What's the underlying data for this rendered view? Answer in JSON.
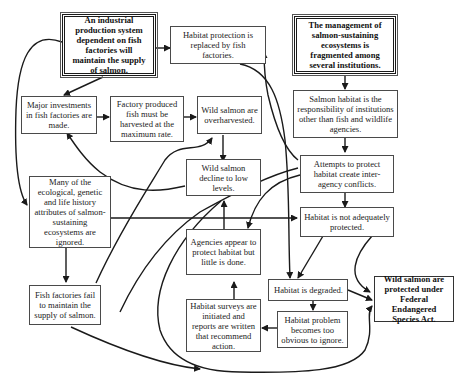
{
  "diagram": {
    "type": "causal-loop flowchart",
    "nodes": {
      "industrial_system": "An industrial production system dependent on fish factories will maintain the supply of salmon.",
      "habitat_protection_replaced": "Habitat protection is replaced by fish factories.",
      "management_fragmented": "The management of salmon-sustaining ecosystems is fragmented among several institutions.",
      "major_investments": "Major investments in fish factories are made.",
      "factory_fish_harvested": "Factory produced fish must be harvested at the maximum rate.",
      "wild_overharvested": "Wild salmon are overharvested.",
      "habitat_responsibility": "Salmon habitat is the responsibility of institutions other than fish and wildlife agencies.",
      "wild_decline": "Wild salmon decline to low levels.",
      "attempts_conflicts": "Attempts to protect habitat create inter-agency conflicts.",
      "attributes_ignored": "Many of the ecological, genetic and life history attributes of salmon-sustaining ecosystems are ignored.",
      "habitat_not_protected": "Habitat is not adequately protected.",
      "agencies_appear": "Agencies appear to protect habitat but little is done.",
      "habitat_degraded": "Habitat is degraded.",
      "factories_fail": "Fish factories fail to maintain the supply of salmon.",
      "surveys_initiated": "Habitat surveys are initiated and reports are written that recommend action.",
      "problem_obvious": "Habitat problem becomes too obvious to ignore.",
      "esa_protected": "Wild salmon are protected under Federal Endangered Species Act."
    },
    "edges": [
      {
        "from": "industrial_system",
        "to": "habitat_protection_replaced"
      },
      {
        "from": "industrial_system",
        "to": "major_investments"
      },
      {
        "from": "industrial_system",
        "to": "attributes_ignored"
      },
      {
        "from": "major_investments",
        "to": "factory_fish_harvested"
      },
      {
        "from": "factory_fish_harvested",
        "to": "wild_overharvested"
      },
      {
        "from": "wild_overharvested",
        "to": "wild_decline"
      },
      {
        "from": "wild_decline",
        "to": "major_investments"
      },
      {
        "from": "management_fragmented",
        "to": "habitat_responsibility"
      },
      {
        "from": "habitat_responsibility",
        "to": "attempts_conflicts"
      },
      {
        "from": "attempts_conflicts",
        "to": "habitat_not_protected"
      },
      {
        "from": "attempts_conflicts",
        "to": "agencies_appear"
      },
      {
        "from": "attributes_ignored",
        "to": "habitat_not_protected"
      },
      {
        "from": "attributes_ignored",
        "to": "factories_fail"
      },
      {
        "from": "factories_fail",
        "to": "wild_overharvested"
      },
      {
        "from": "factories_fail",
        "to": "surveys_initiated_loop"
      },
      {
        "from": "habitat_protection_replaced",
        "to": "habitat_degraded"
      },
      {
        "from": "habitat_degraded",
        "to": "habitat_protection_replaced"
      },
      {
        "from": "habitat_not_protected",
        "to": "habitat_degraded"
      },
      {
        "from": "habitat_not_protected",
        "to": "esa_protected"
      },
      {
        "from": "habitat_degraded",
        "to": "esa_protected"
      },
      {
        "from": "habitat_degraded",
        "to": "problem_obvious"
      },
      {
        "from": "problem_obvious",
        "to": "surveys_initiated"
      },
      {
        "from": "surveys_initiated",
        "to": "agencies_appear"
      },
      {
        "from": "agencies_appear",
        "to": "wild_decline"
      },
      {
        "from": "attempts_conflicts",
        "to": "habitat_protection_replaced"
      },
      {
        "from": "wild_decline",
        "to": "esa_protected"
      }
    ]
  }
}
